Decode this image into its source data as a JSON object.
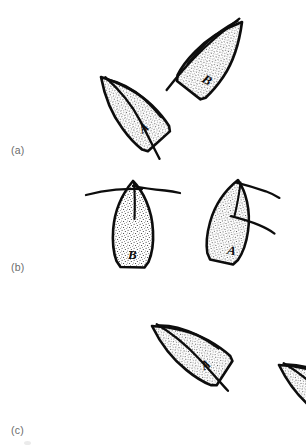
{
  "figure": {
    "background_color": "#ffffff",
    "ink_color": "#0d0d0d",
    "stipple_color": "#1a1a1a",
    "label_color": "#6b6b6b",
    "width": 306,
    "height": 448,
    "panels": [
      {
        "id": "a",
        "label": "(a)",
        "label_position": {
          "x": 11,
          "y": 145
        },
        "leaves": [
          {
            "id": "a-left",
            "letter": "A",
            "letter_position": {
              "x": 85,
              "y": 133
            },
            "letter_rotation": -38,
            "tip": {
              "x": 131,
              "y": 76
            },
            "base": {
              "x": 71,
              "y": 142
            },
            "rotation": -42,
            "length": 88,
            "width": 36,
            "twig_style": "tip-stem-crossing"
          },
          {
            "id": "a-right",
            "letter": "B",
            "letter_position": {
              "x": 268,
              "y": 77
            },
            "letter_rotation": 42,
            "tip": {
              "x": 232,
              "y": 16
            },
            "base": {
              "x": 283,
              "y": 86
            },
            "rotation": 38,
            "length": 88,
            "width": 38,
            "twig_style": "tip-stem-crossing"
          }
        ]
      },
      {
        "id": "b",
        "label": "(b)",
        "label_position": {
          "x": 11,
          "y": 262
        },
        "leaves": [
          {
            "id": "b-left",
            "letter": "B",
            "letter_position": {
              "x": 133,
              "y": 258
            },
            "letter_rotation": 0,
            "tip": {
              "x": 133,
              "y": 181
            },
            "base": {
              "x": 133,
              "y": 267
            },
            "rotation": 0,
            "length": 86,
            "width": 34,
            "twig_style": "horizontal-branches"
          },
          {
            "id": "b-right",
            "letter": "A",
            "letter_position": {
              "x": 257,
              "y": 252
            },
            "letter_rotation": 8,
            "tip": {
              "x": 234,
              "y": 180
            },
            "base": {
              "x": 262,
              "y": 263
            },
            "rotation": 11,
            "length": 84,
            "width": 34,
            "twig_style": "horizontal-branches"
          }
        ]
      },
      {
        "id": "c",
        "label": "(c)",
        "label_position": {
          "x": 11,
          "y": 425
        },
        "leaves": [
          {
            "id": "c-left",
            "letter": "A",
            "letter_position": {
              "x": 107,
              "y": 363
            },
            "letter_rotation": -28,
            "tip": {
              "x": 160,
              "y": 321
            },
            "base": {
              "x": 92,
              "y": 367
            },
            "rotation": -32,
            "length": 82,
            "width": 36,
            "twig_style": "tip-stem-crossing"
          },
          {
            "id": "c-right",
            "letter": "B",
            "letter_position": {
              "x": 231,
              "y": 406
            },
            "letter_rotation": -28,
            "tip": {
              "x": 288,
              "y": 360
            },
            "base": {
              "x": 217,
              "y": 409
            },
            "rotation": -32,
            "length": 84,
            "width": 37,
            "twig_style": "tip-stem-crossing"
          }
        ]
      }
    ],
    "artifacts": [
      {
        "id": "smudge-below-c",
        "x": 24,
        "y": 441,
        "w": 7,
        "h": 4
      }
    ]
  }
}
